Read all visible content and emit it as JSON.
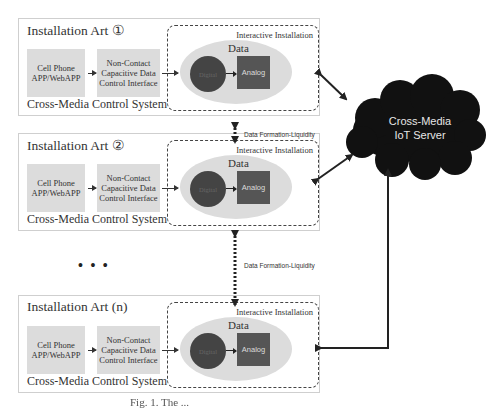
{
  "diagram": {
    "installations": [
      {
        "title": "Installation Art ①",
        "cell_phone": "Cell Phone APP/WebAPP",
        "interface": "Non-Contact Capacitive Data Control Interface",
        "data_label": "Data",
        "digital_label": "Digital",
        "analog_label": "Analog",
        "interactive_label": "Interactive Installation",
        "footer": "Cross-Media Control System"
      },
      {
        "title": "Installation Art ②",
        "cell_phone": "Cell Phone APP/WebAPP",
        "interface": "Non-Contact Capacitive Data Control Interface",
        "data_label": "Data",
        "digital_label": "Digital",
        "analog_label": "Analog",
        "interactive_label": "Interactive Installation",
        "footer": "Cross-Media Control System"
      },
      {
        "title": "Installation Art (n)",
        "cell_phone": "Cell Phone APP/WebAPP",
        "interface": "Non-Contact Capacitive Data Control Interface",
        "data_label": "Data",
        "digital_label": "Digital",
        "analog_label": "Analog",
        "interactive_label": "Interactive Installation",
        "footer": "Cross-Media Control System"
      }
    ],
    "flow_labels": [
      "Data Formation-Liquidity",
      "Data Formation-Liquidity"
    ],
    "ellipsis": "• • •",
    "server_label_line1": "Cross-Media",
    "server_label_line2": "IoT Server",
    "caption": "Fig. 1. The ..."
  },
  "colors": {
    "box_fill": "#dcdcdc",
    "digital_fill": "#444444",
    "analog_fill": "#555555",
    "cloud_fill": "#111111",
    "arrow": "#222222"
  }
}
